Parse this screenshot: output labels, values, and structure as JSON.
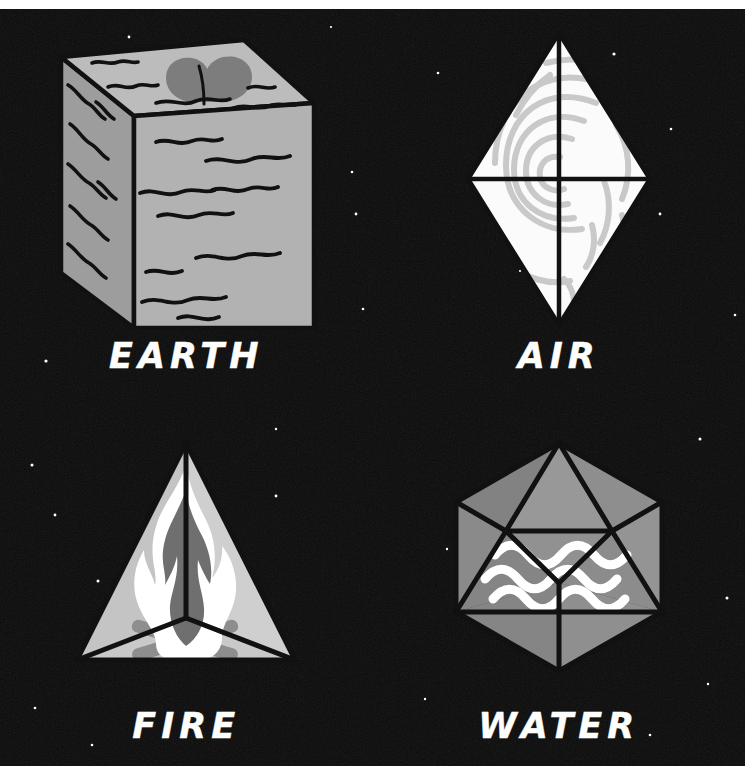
{
  "poster": {
    "title": "The Four Classical Elements",
    "background_color": "#0a0a0a",
    "frame_color": "#ffffff",
    "label_color": "#fdfdfb"
  },
  "elements": [
    {
      "key": "earth",
      "label": "EARTH",
      "solid": "cube",
      "icon_name": "earth-cube-icon",
      "motif": "sprout",
      "fill_color": "#b0b0b0",
      "side_fill_color": "#9a9a9a",
      "top_fill_color": "#bdbdbd",
      "motif_color": "#7d7d7d",
      "stroke_color": "#111111"
    },
    {
      "key": "air",
      "label": "AIR",
      "solid": "octahedron",
      "icon_name": "air-octahedron-icon",
      "motif": "wind-swirl",
      "fill_color": "#fbfbfb",
      "motif_color": "#c9c9c9",
      "stroke_color": "#111111"
    },
    {
      "key": "fire",
      "label": "FIRE",
      "solid": "tetrahedron",
      "icon_name": "fire-tetrahedron-icon",
      "motif": "flame-and-logs",
      "fill_color": "#c8c8c8",
      "face_left_color": "#c3c3c3",
      "face_right_color": "#cfcfcf",
      "flame_outline_color": "#ffffff",
      "flame_core_color": "#6f6f6f",
      "logs_color": "#8e8e8e",
      "stroke_color": "#111111"
    },
    {
      "key": "water",
      "label": "WATER",
      "solid": "icosahedron",
      "icon_name": "water-icosahedron-icon",
      "motif": "waves",
      "fill_color": "#8a8a8a",
      "face_light_color": "#949494",
      "face_dark_color": "#7e7e7e",
      "motif_color": "#ffffff",
      "stroke_color": "#111111"
    }
  ]
}
